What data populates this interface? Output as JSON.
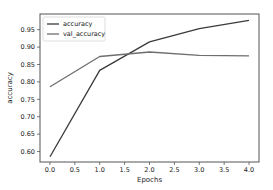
{
  "chart_data": {
    "type": "line",
    "title": "",
    "xlabel": "Epochs",
    "ylabel": "accuracy",
    "x": [
      0,
      1,
      2,
      3,
      4
    ],
    "xlim": [
      -0.2,
      4.2
    ],
    "ylim": [
      0.57,
      0.995
    ],
    "xticks": [
      0.0,
      0.5,
      1.0,
      1.5,
      2.0,
      2.5,
      3.0,
      3.5,
      4.0
    ],
    "xtick_labels": [
      "0.0",
      "0.5",
      "1.0",
      "1.5",
      "2.0",
      "2.5",
      "3.0",
      "3.5",
      "4.0"
    ],
    "yticks": [
      0.6,
      0.65,
      0.7,
      0.75,
      0.8,
      0.85,
      0.9,
      0.95
    ],
    "ytick_labels": [
      "0.60",
      "0.65",
      "0.70",
      "0.75",
      "0.80",
      "0.85",
      "0.90",
      "0.95"
    ],
    "grid": false,
    "legend": "top-left",
    "series": [
      {
        "name": "accuracy",
        "color": "#3a3a3a",
        "values": [
          0.585,
          0.833,
          0.915,
          0.953,
          0.977
        ]
      },
      {
        "name": "val_accuracy",
        "color": "#6e6e6e",
        "values": [
          0.786,
          0.873,
          0.886,
          0.876,
          0.875
        ]
      }
    ]
  }
}
